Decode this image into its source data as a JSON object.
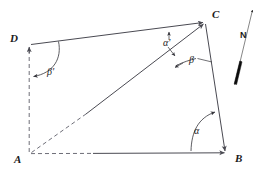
{
  "figure": {
    "background_color": "#ffffff",
    "line_color": "#4a4a52",
    "dash_color": "#6e6e78",
    "label_color": "#1a1a1a",
    "needle_color": "#0d0d0d"
  },
  "vertices": [
    {
      "id": "A",
      "label": "A",
      "x": 29,
      "y": 154,
      "label_x": 14,
      "label_y": 163
    },
    {
      "id": "B",
      "label": "B",
      "x": 226,
      "y": 153,
      "label_x": 235,
      "label_y": 162
    },
    {
      "id": "C",
      "label": "C",
      "x": 205,
      "y": 22,
      "label_x": 212,
      "label_y": 17
    },
    {
      "id": "D",
      "label": "D",
      "x": 29,
      "y": 45,
      "label_x": 11,
      "label_y": 42
    }
  ],
  "edges": [
    {
      "name": "edge-D-C",
      "from": "D",
      "to": "C",
      "style": "solid"
    },
    {
      "name": "edge-C-B",
      "from": "C",
      "to": "B",
      "style": "solid"
    },
    {
      "name": "edge-A-B",
      "from": "A",
      "to": "B",
      "style": "dashed-then-solid"
    },
    {
      "name": "edge-A-C",
      "from": "A",
      "to": "C",
      "style": "dashed-then-solid"
    },
    {
      "name": "edge-A-D-meridian",
      "from": "A",
      "to": "D",
      "style": "dashed"
    }
  ],
  "angles": [
    {
      "name": "angle-alpha",
      "label": "α",
      "at_vertex": "B",
      "label_x": 196,
      "label_y": 133,
      "between": [
        "B-A",
        "B-C"
      ]
    },
    {
      "name": "angle-beta",
      "label": "β",
      "at_vertex": "C",
      "label_x": 191,
      "label_y": 62,
      "between": [
        "C-A",
        "C-B"
      ]
    },
    {
      "name": "angle-alpha-prime",
      "label": "α'",
      "at_vertex": "C",
      "label_x": 164,
      "label_y": 45,
      "between": [
        "C-D",
        "C-A"
      ]
    },
    {
      "name": "angle-beta-prime",
      "label": "β'",
      "at_vertex": "D",
      "label_x": 49,
      "label_y": 74,
      "between": [
        "D-meridian",
        "D-C"
      ]
    }
  ],
  "north_arrow": {
    "name": "north-arrow",
    "label": "N",
    "label_x": 243,
    "label_y": 37,
    "tip_x": 253,
    "tip_y": 8,
    "tail_x": 234,
    "tail_y": 86,
    "needle_top_x": 240,
    "needle_top_y": 60,
    "needle_bottom_x": 234,
    "needle_bottom_y": 84
  }
}
